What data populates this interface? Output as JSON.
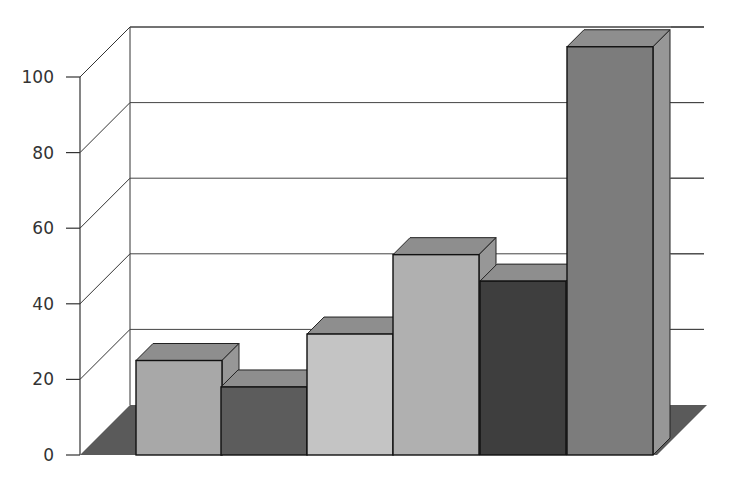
{
  "chart_data": {
    "type": "bar",
    "style": "3d-column",
    "title": "",
    "xlabel": "",
    "ylabel": "",
    "categories": [
      "1",
      "2",
      "3",
      "4",
      "5",
      "6"
    ],
    "values": [
      25,
      18,
      32,
      53,
      46,
      108
    ],
    "bar_colors": [
      "#a8a8a8",
      "#5c5c5c",
      "#c4c4c4",
      "#b0b0b0",
      "#3e3e3e",
      "#7c7c7c"
    ],
    "ylim": [
      0,
      100
    ],
    "yticks": [
      0,
      20,
      40,
      60,
      80,
      100
    ],
    "ytick_labels": [
      "0",
      "20",
      "40",
      "60",
      "80",
      "100"
    ],
    "grid": true,
    "legend": null,
    "floor_color": "#5a5a5a"
  }
}
